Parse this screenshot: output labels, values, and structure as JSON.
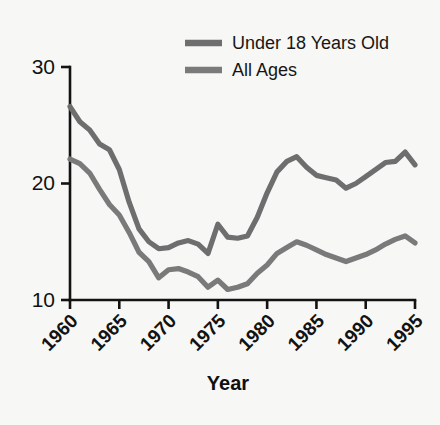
{
  "chart_data": {
    "type": "line",
    "title": "",
    "xlabel": "Year",
    "ylabel": "",
    "xlim": [
      1960,
      1995
    ],
    "ylim": [
      10,
      30
    ],
    "grid": false,
    "legend_position": "top-right",
    "xticks": [
      1960,
      1965,
      1970,
      1975,
      1980,
      1985,
      1990,
      1995
    ],
    "xtick_labels": [
      "1960",
      "1965",
      "1970",
      "1975",
      "1980",
      "1985",
      "1990",
      "1995"
    ],
    "yticks": [
      10,
      20,
      30
    ],
    "ytick_labels": [
      "10",
      "20",
      "30"
    ],
    "x": [
      1960,
      1961,
      1962,
      1963,
      1964,
      1965,
      1966,
      1967,
      1968,
      1969,
      1970,
      1971,
      1972,
      1973,
      1974,
      1975,
      1976,
      1977,
      1978,
      1979,
      1980,
      1981,
      1982,
      1983,
      1984,
      1985,
      1986,
      1987,
      1988,
      1989,
      1990,
      1991,
      1992,
      1993,
      1994,
      1995
    ],
    "series": [
      {
        "name": "Under 18 Years Old",
        "color": "#6e6e6e",
        "values": [
          26.6,
          25.3,
          24.6,
          23.4,
          22.9,
          21.2,
          18.4,
          16.1,
          15.0,
          14.4,
          14.5,
          14.9,
          15.1,
          14.8,
          14.0,
          16.5,
          15.4,
          15.3,
          15.5,
          17.1,
          19.2,
          21.0,
          21.9,
          22.3,
          21.4,
          20.7,
          20.5,
          20.3,
          19.6,
          20.0,
          20.6,
          21.2,
          21.8,
          21.9,
          22.7,
          21.6
        ]
      },
      {
        "name": "All Ages",
        "color": "#7a7a7a",
        "values": [
          22.1,
          21.7,
          20.9,
          19.5,
          18.2,
          17.3,
          15.8,
          14.1,
          13.3,
          11.9,
          12.6,
          12.7,
          12.4,
          12.0,
          11.1,
          11.7,
          10.9,
          11.1,
          11.4,
          12.3,
          13.0,
          14.0,
          14.5,
          15.0,
          14.7,
          14.3,
          13.9,
          13.6,
          13.3,
          13.6,
          13.9,
          14.3,
          14.8,
          15.2,
          15.5,
          14.9
        ]
      }
    ],
    "legend_entries": [
      {
        "label": "Under 18 Years Old",
        "color": "#6e6e6e"
      },
      {
        "label": "All Ages",
        "color": "#7a7a7a"
      }
    ]
  },
  "colors": {
    "background": "#f7f7f5",
    "axis": "#131313",
    "text": "#121212",
    "series_under18": "#6e6e6e",
    "series_allages": "#7a7a7a"
  }
}
